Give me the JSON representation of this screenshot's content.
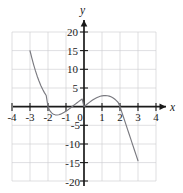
{
  "figure": {
    "name": "coordinate-plane-cubic-graph",
    "background_color": "#ffffff",
    "grid_color": "#c9c9cf",
    "axis_color": "#1a1a1a",
    "curve_color": "#7a7a80"
  },
  "axes": {
    "x_axis_label": "x",
    "y_axis_label": "y",
    "x_ticks": [
      "-4",
      "-3",
      "-2",
      "-1",
      "1",
      "2",
      "3",
      "4"
    ],
    "x_tick_values": [
      -4,
      -3,
      -2,
      -1,
      1,
      2,
      3,
      4
    ],
    "y_ticks": [
      "20",
      "15",
      "10",
      "5",
      "-5",
      "-10",
      "-15",
      "-20"
    ],
    "y_tick_values": [
      20,
      15,
      10,
      5,
      -5,
      -10,
      -15,
      -20
    ],
    "origin_label": "0",
    "xlim": [
      -4.4,
      4.4
    ],
    "ylim": [
      -21.5,
      21.5
    ],
    "grid": true,
    "grid_spacing_x": 1,
    "grid_spacing_y": 5
  },
  "chart_data": {
    "type": "line",
    "title": "",
    "subtitle": "",
    "xlabel": "x",
    "ylabel": "y",
    "xlim": [
      -4.4,
      4.4
    ],
    "ylim": [
      -21.5,
      21.5
    ],
    "grid": true,
    "legend": null,
    "x_ticks": [
      -4,
      -3,
      -2,
      -1,
      0,
      1,
      2,
      3,
      4
    ],
    "y_ticks": [
      -20,
      -15,
      -10,
      -5,
      0,
      5,
      10,
      15,
      20
    ],
    "x_tick_labels": [
      "-4",
      "-3",
      "-2",
      "-1",
      "0",
      "1",
      "2",
      "3",
      "4"
    ],
    "y_tick_labels": [
      "-20",
      "-15",
      "-10",
      "-5",
      "0",
      "5",
      "10",
      "15",
      "20"
    ],
    "series": [
      {
        "name": "curve",
        "color": "#7a7a80",
        "x": [
          -3.0,
          -2.9,
          -2.8,
          -2.7,
          -2.6,
          -2.5,
          -2.4,
          -2.3,
          -2.2,
          -2.1,
          -2.0,
          -1.9,
          -1.8,
          -1.7,
          -1.6,
          -1.5,
          -1.4,
          -1.3,
          -1.2,
          -1.1,
          -1.0,
          -0.9,
          -0.8,
          -0.7,
          -0.6,
          -0.5,
          -0.4,
          -0.3,
          -0.2,
          -0.1,
          0.0,
          0.1,
          0.2,
          0.3,
          0.4,
          0.5,
          0.6,
          0.7,
          0.8,
          0.9,
          1.0,
          1.1,
          1.2,
          1.3,
          1.4,
          1.5,
          1.6,
          1.7,
          1.8,
          1.9,
          2.0,
          2.1,
          2.2,
          2.3,
          2.4,
          2.5,
          2.6,
          2.7,
          2.8,
          2.9,
          3.0
        ],
        "y": [
          15.0,
          13.07,
          11.29,
          9.66,
          8.18,
          6.88,
          5.7,
          4.67,
          3.77,
          3.0,
          0.0,
          -1.06,
          -1.66,
          -2.01,
          -2.18,
          -2.22,
          -2.15,
          -2.0,
          -1.78,
          -1.51,
          -1.2,
          -0.87,
          -0.51,
          -0.14,
          0.24,
          0.62,
          1.0,
          1.37,
          1.72,
          2.05,
          0.0,
          0.4,
          0.79,
          1.16,
          1.51,
          1.84,
          2.14,
          2.4,
          2.62,
          2.79,
          2.91,
          2.98,
          3.0,
          2.95,
          2.84,
          2.65,
          2.39,
          2.05,
          1.63,
          1.12,
          0.0,
          -1.45,
          -2.9,
          -4.35,
          -5.8,
          -7.25,
          -8.7,
          -10.15,
          -11.6,
          -13.05,
          -14.5
        ]
      }
    ],
    "roots_visible": [
      -2,
      0,
      2
    ],
    "local_max": {
      "x": 1.2,
      "y": 3.0
    },
    "local_min": {
      "x": -1.5,
      "y": -2.2
    }
  }
}
